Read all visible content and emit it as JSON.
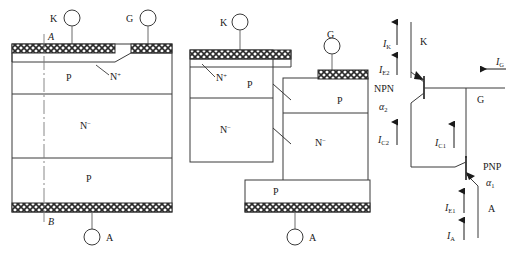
{
  "figure": {
    "line_color": "#3a3a3a",
    "hatch_color": "#2b2b2b",
    "text_color": "#1a1a1a"
  },
  "panel_a": {
    "name": "planar-thyristor-cross-section",
    "terminals": [
      {
        "id": "k",
        "label": "K",
        "label_side": "left"
      },
      {
        "id": "g",
        "label": "G",
        "label_side": "left"
      },
      {
        "id": "a",
        "label": "A",
        "label_side": "right"
      }
    ],
    "section_line": {
      "top_label": "A",
      "bottom_label": "B",
      "style": "dash-dot"
    },
    "layers": [
      {
        "id": "n-plus",
        "label": "N",
        "superscript": "+",
        "callout": true
      },
      {
        "id": "p-base",
        "label": "P",
        "superscript": ""
      },
      {
        "id": "n-drift",
        "label": "N",
        "superscript": "−"
      },
      {
        "id": "p-emitter",
        "label": "P",
        "superscript": ""
      }
    ],
    "contacts": [
      {
        "id": "cathode-metal",
        "style": "cross-hatch"
      },
      {
        "id": "gate-metal",
        "style": "cross-hatch"
      },
      {
        "id": "anode-metal",
        "style": "cross-hatch"
      }
    ]
  },
  "panel_b": {
    "name": "two-transistor-split-structure",
    "terminals": [
      {
        "id": "k",
        "label": "K",
        "label_side": "left"
      },
      {
        "id": "g",
        "label": "G",
        "label_side": "above"
      },
      {
        "id": "a",
        "label": "A",
        "label_side": "right"
      }
    ],
    "left_block_layers": [
      {
        "id": "n-plus",
        "label": "N",
        "superscript": "+",
        "callout": true
      },
      {
        "id": "p-base",
        "label": "P",
        "superscript": ""
      },
      {
        "id": "n-drift",
        "label": "N",
        "superscript": "−"
      }
    ],
    "right_block_layers": [
      {
        "id": "p-base-right",
        "label": "P",
        "superscript": ""
      },
      {
        "id": "n-drift-right",
        "label": "N",
        "superscript": "−"
      }
    ],
    "bottom_block_layers": [
      {
        "id": "p-emitter",
        "label": "P",
        "superscript": ""
      }
    ],
    "contacts": [
      {
        "id": "cathode-metal",
        "style": "cross-hatch"
      },
      {
        "id": "gate-metal",
        "style": "cross-hatch"
      },
      {
        "id": "anode-metal",
        "style": "cross-hatch"
      }
    ],
    "connectors": [
      {
        "id": "upper-diagonal"
      },
      {
        "id": "lower-diagonal"
      }
    ]
  },
  "panel_c": {
    "name": "equivalent-circuit",
    "transistors": [
      {
        "id": "npn",
        "type": "NPN",
        "alpha": "α",
        "alpha_sub": "2"
      },
      {
        "id": "pnp",
        "type": "PNP",
        "alpha": "α",
        "alpha_sub": "1"
      }
    ],
    "terminals": [
      {
        "id": "k",
        "label": "K"
      },
      {
        "id": "g",
        "label": "G"
      },
      {
        "id": "a",
        "label": "A"
      }
    ],
    "currents": [
      {
        "id": "ik",
        "symbol": "I",
        "sub": "K",
        "direction": "up"
      },
      {
        "id": "ie2",
        "symbol": "I",
        "sub": "E2",
        "direction": "up"
      },
      {
        "id": "ic2",
        "symbol": "I",
        "sub": "C2",
        "direction": "up"
      },
      {
        "id": "ic1",
        "symbol": "I",
        "sub": "C1",
        "direction": "up"
      },
      {
        "id": "ie1",
        "symbol": "I",
        "sub": "E1",
        "direction": "up"
      },
      {
        "id": "ia",
        "symbol": "I",
        "sub": "A",
        "direction": "up"
      },
      {
        "id": "ig",
        "symbol": "I",
        "sub": "G",
        "direction": "left"
      }
    ]
  }
}
